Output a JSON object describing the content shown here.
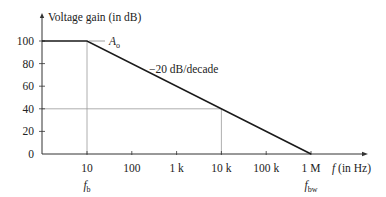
{
  "chart_data": {
    "type": "line",
    "title": "",
    "ylabel": "Voltage gain (in dB)",
    "xlabel_italic": "f",
    "xlabel_rest": " (in Hz)",
    "x_scale": "log",
    "xlim": [
      1,
      10000000
    ],
    "ylim": [
      0,
      100
    ],
    "x_ticks": [
      {
        "value": 10,
        "label": "10"
      },
      {
        "value": 100,
        "label": "100"
      },
      {
        "value": 1000,
        "label": "1 k"
      },
      {
        "value": 10000,
        "label": "10 k"
      },
      {
        "value": 100000,
        "label": "100 k"
      },
      {
        "value": 1000000,
        "label": "1 M"
      }
    ],
    "y_ticks": [
      0,
      20,
      40,
      60,
      80,
      100
    ],
    "series": [
      {
        "name": "Open-loop gain",
        "x": [
          1,
          10,
          1000000
        ],
        "y": [
          100,
          100,
          0
        ]
      }
    ],
    "guides": [
      {
        "type": "vertical",
        "x": 10,
        "y_to": 100
      },
      {
        "type": "crosshair",
        "x": 10000,
        "y": 40
      }
    ],
    "annotations": [
      {
        "id": "ao",
        "main": "A",
        "sub": "o",
        "x": 10,
        "y": 100
      },
      {
        "id": "slope",
        "text": "−20 dB/decade",
        "x": 1000,
        "y": 60
      },
      {
        "id": "fb",
        "main": "f",
        "sub": "b",
        "x": 10
      },
      {
        "id": "fbw",
        "main": "f",
        "sub": "bw",
        "x": 1000000
      }
    ],
    "grid": false,
    "colors": {
      "line": "#1a1a1a",
      "axis": "#333333",
      "guide": "#9a9a9a"
    }
  }
}
